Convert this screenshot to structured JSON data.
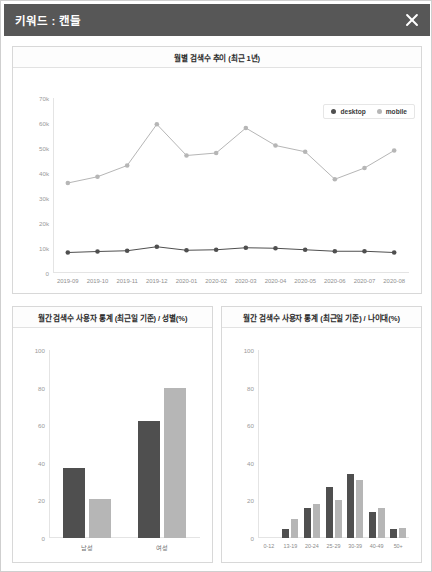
{
  "window": {
    "title": "키워드 : 캔들",
    "close_label": "닫기",
    "close_icon": "close-icon",
    "header_color": "#575757"
  },
  "colors": {
    "desktop": "#4f4f4f",
    "mobile": "#b6b6b6",
    "grid": "#e4e4e4",
    "panel_border": "#d8d8d8"
  },
  "charts": {
    "trend": {
      "title": "월별 검색수 추이 (최근 1년)",
      "legend": [
        {
          "label": "desktop",
          "color": "#4f4f4f"
        },
        {
          "label": "mobile",
          "color": "#b6b6b6"
        }
      ]
    },
    "gender": {
      "title": "월간 검색수 사용자 통계 (최근일 기준) / 성별(%)"
    },
    "age": {
      "title": "월간 검색수 사용자 통계 (최근일 기준) / 나이대(%)"
    }
  },
  "chart_data": [
    {
      "id": "trend",
      "type": "line",
      "title": "월별 검색수 추이 (최근 1년)",
      "xlabel": "",
      "ylabel": "",
      "ylim": [
        0,
        70000
      ],
      "yticks": [
        0,
        10000,
        20000,
        30000,
        40000,
        50000,
        60000,
        70000
      ],
      "ytick_labels": [
        "0",
        "10k",
        "20k",
        "30k",
        "40k",
        "50k",
        "60k",
        "70k"
      ],
      "grid": false,
      "legend_position": "top-right",
      "categories": [
        "2019-09",
        "2019-10",
        "2019-11",
        "2019-12",
        "2020-01",
        "2020-02",
        "2020-03",
        "2020-04",
        "2020-05",
        "2020-06",
        "2020-07",
        "2020-08"
      ],
      "series": [
        {
          "name": "desktop",
          "color": "#4f4f4f",
          "values": [
            8200,
            8600,
            8900,
            10500,
            9100,
            9300,
            10100,
            9900,
            9300,
            8700,
            8700,
            8200
          ]
        },
        {
          "name": "mobile",
          "color": "#b6b6b6",
          "values": [
            36000,
            38500,
            43000,
            59500,
            47000,
            48000,
            58000,
            51000,
            48500,
            37500,
            42000,
            49000
          ]
        }
      ]
    },
    {
      "id": "gender",
      "type": "bar",
      "title": "월간 검색수 사용자 통계 (최근일 기준) / 성별(%)",
      "xlabel": "",
      "ylabel": "",
      "ylim": [
        0,
        100
      ],
      "yticks": [
        0,
        20,
        40,
        60,
        80,
        100
      ],
      "ytick_labels": [
        "0",
        "20",
        "40",
        "60",
        "80",
        "100"
      ],
      "grid": false,
      "categories": [
        "남성",
        "여성"
      ],
      "series": [
        {
          "name": "desktop",
          "color": "#4f4f4f",
          "values": [
            37,
            62
          ]
        },
        {
          "name": "mobile",
          "color": "#b6b6b6",
          "values": [
            21,
            80
          ]
        }
      ]
    },
    {
      "id": "age",
      "type": "bar",
      "title": "월간 검색수 사용자 통계 (최근일 기준) / 나이대(%)",
      "xlabel": "",
      "ylabel": "",
      "ylim": [
        0,
        100
      ],
      "yticks": [
        0,
        20,
        40,
        60,
        80,
        100
      ],
      "ytick_labels": [
        "0",
        "20",
        "40",
        "60",
        "80",
        "100"
      ],
      "grid": false,
      "categories": [
        "0-12",
        "13-19",
        "20-24",
        "25-29",
        "30-39",
        "40-49",
        "50+"
      ],
      "series": [
        {
          "name": "desktop",
          "color": "#4f4f4f",
          "values": [
            0,
            5,
            16,
            27,
            34,
            14,
            5
          ]
        },
        {
          "name": "mobile",
          "color": "#b6b6b6",
          "values": [
            0,
            10,
            18,
            20,
            31,
            16,
            5.5
          ]
        }
      ]
    }
  ]
}
